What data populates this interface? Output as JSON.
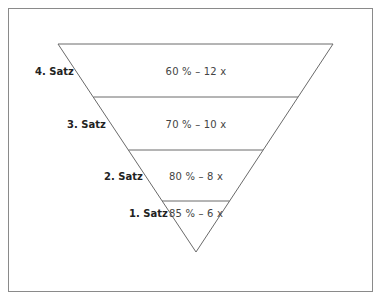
{
  "diagram": {
    "type": "inverted-pyramid",
    "levels": [
      {
        "label": "4. Satz",
        "value": "60 % – 12 x"
      },
      {
        "label": "3. Satz",
        "value": "70 % – 10 x"
      },
      {
        "label": "2. Satz",
        "value": "80 % – 8 x"
      },
      {
        "label": "1. Satz",
        "value": "85 % – 6 x"
      }
    ]
  },
  "colors": {
    "line": "#6a6a6a",
    "frame": "#8a8a8a",
    "label_text": "#222222",
    "value_text": "#444444"
  }
}
